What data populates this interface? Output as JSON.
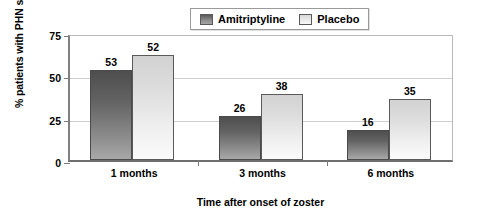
{
  "chart_data": {
    "type": "bar",
    "title": "",
    "subtitle": "",
    "xlabel": "Time after onset of zoster",
    "ylabel": "% patients with PHN symptoms",
    "categories": [
      "1 months",
      "3 months",
      "6 months"
    ],
    "series": [
      {
        "name": "Amitriptyline",
        "values": [
          53,
          26,
          16
        ],
        "drawn_values": [
          53,
          26,
          18
        ],
        "color": "#707070"
      },
      {
        "name": "Placebo",
        "values": [
          52,
          38,
          35
        ],
        "drawn_values": [
          62,
          39,
          36
        ],
        "color": "#e8e8e8"
      }
    ],
    "ylim": [
      0,
      75
    ],
    "yticks": [
      0,
      25,
      50,
      75
    ],
    "ytick_labels": [
      "0",
      "25",
      "50",
      "75"
    ],
    "grid": true,
    "legend_position": "top-center",
    "data_labels": true
  },
  "legend": {
    "items": [
      {
        "label": "Amitriptyline",
        "swatch": "series0"
      },
      {
        "label": "Placebo",
        "swatch": "series1"
      }
    ]
  },
  "axes": {
    "y_title": "% patients with PHN symptoms",
    "x_title": "Time after onset of zoster"
  }
}
